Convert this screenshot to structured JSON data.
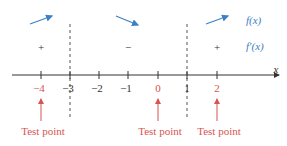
{
  "diagram": {
    "type": "sign-chart",
    "axis": {
      "variable": "x",
      "ticks": [
        {
          "value": -4,
          "label": "−4",
          "is_test_point": true
        },
        {
          "value": -3,
          "label": "−3",
          "is_test_point": false
        },
        {
          "value": -2,
          "label": "−2",
          "is_test_point": false
        },
        {
          "value": -1,
          "label": "−1",
          "is_test_point": false
        },
        {
          "value": 0,
          "label": "0",
          "is_test_point": true
        },
        {
          "value": 1,
          "label": "1",
          "is_test_point": false
        },
        {
          "value": 2,
          "label": "2",
          "is_test_point": true
        }
      ]
    },
    "critical_points": [
      -3,
      1
    ],
    "intervals": [
      {
        "range": "(-inf, -3)",
        "sign": "+",
        "behavior": "increasing"
      },
      {
        "range": "(-3, 1)",
        "sign": "−",
        "behavior": "decreasing"
      },
      {
        "range": "(1, inf)",
        "sign": "+",
        "behavior": "increasing"
      }
    ],
    "legend": {
      "function_label": "f(x)",
      "derivative_label": "f′(x)"
    },
    "test_points": [
      {
        "value": -4,
        "label": "Test point"
      },
      {
        "value": 0,
        "label": "Test point"
      },
      {
        "value": 2,
        "label": "Test point"
      }
    ],
    "colors": {
      "arrow_blue": "#3b7fc4",
      "test_red": "#d9534f",
      "axis": "#333333"
    }
  }
}
